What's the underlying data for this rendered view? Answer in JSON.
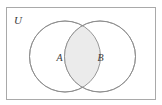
{
  "figure": {
    "kind": "venn-diagram",
    "background_color": "#ffffff"
  },
  "universe": {
    "label": "U",
    "border_color": "#a9a9a9",
    "fill_color": "#ffffff",
    "rect": {
      "x": 6.5,
      "y": 7.5,
      "width": 149,
      "height": 92
    }
  },
  "sets": [
    {
      "label": "A",
      "name": "set-a",
      "circle": {
        "cx": 65,
        "cy": 56.5,
        "r": 35.5
      },
      "label_pos": {
        "x": 59.5,
        "y": 60.5
      },
      "fill_color": "#ffffff",
      "stroke_color": "#8c8c8c"
    },
    {
      "label": "B",
      "name": "set-b",
      "circle": {
        "cx": 100,
        "cy": 56.5,
        "r": 35.5
      },
      "label_pos": {
        "x": 100.5,
        "y": 60.5
      },
      "fill_color": "#ffffff",
      "stroke_color": "#8c8c8c"
    }
  ],
  "shaded_region": {
    "name": "a-intersect-b",
    "description": "A intersect B",
    "fill_color": "#ebebeb",
    "stroke_color": "#8c8c8c"
  },
  "colors": {
    "frame_stroke": "#a9a9a9",
    "circle_stroke": "#8c8c8c",
    "shading": "#ebebeb",
    "text": "#3a3a3a",
    "page_background": "#ffffff"
  }
}
